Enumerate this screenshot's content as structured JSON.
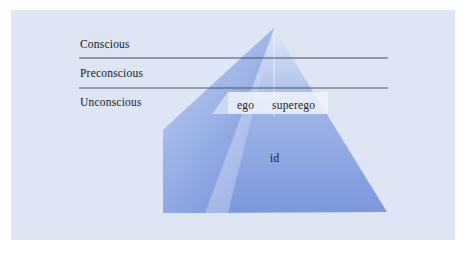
{
  "figure": {
    "panel_background": "#dee6f6",
    "page_background": "#ffffff"
  },
  "levels": {
    "divider_color": "#4a4f5e",
    "items": [
      {
        "key": "conscious",
        "label": "Conscious"
      },
      {
        "key": "preconscious",
        "label": "Preconscious"
      },
      {
        "key": "unconscious",
        "label": "Unconscious"
      }
    ],
    "dividers": [
      {
        "key": "conscious-preconscious-divider",
        "y": 58,
        "x1": 79,
        "x2": 388
      },
      {
        "key": "preconscious-unconscious-divider",
        "y": 88,
        "x1": 79,
        "x2": 388
      }
    ]
  },
  "structures": {
    "items": [
      {
        "key": "ego",
        "label": "ego"
      },
      {
        "key": "superego",
        "label": "superego"
      },
      {
        "key": "id",
        "label": "id"
      }
    ]
  },
  "pyramid": {
    "apex": {
      "x": 274,
      "y": 28
    },
    "front_left_corner": {
      "x": 205,
      "y": 213
    },
    "bottom_right_corner": {
      "x": 387,
      "y": 212
    },
    "back_left_corner": {
      "x": 163,
      "y": 130
    },
    "back_left_bottom": {
      "x": 163,
      "y": 213
    },
    "colors": {
      "front_right_face_top": "#cfdcf4",
      "front_right_face_bottom": "#7d9ade",
      "left_face_top": "#c4d3f1",
      "left_face_bottom": "#7b98dd",
      "back_face": "#a8bdec",
      "highlight_band": "#eef2fb",
      "edge": "#8fa8e2"
    }
  }
}
